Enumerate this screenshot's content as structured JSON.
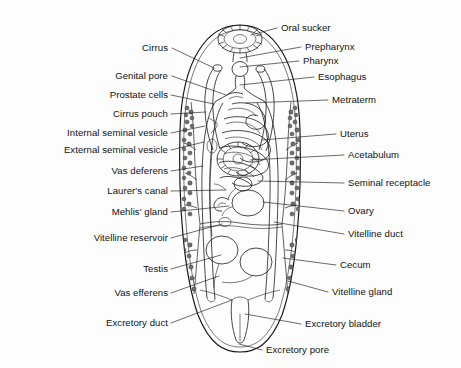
{
  "figure": {
    "style": "black and white scanned line drawing with stippled shading",
    "background_color": "#fdfdfd",
    "ink_color": "#141414",
    "label_count": 24
  },
  "labels_left": [
    {
      "id": "cirrus",
      "text": "Cirrus",
      "text_x": 168,
      "text_y": 51,
      "leader": "M172,48 L214,68"
    },
    {
      "id": "genital-pore",
      "text": "Genital pore",
      "text_x": 168,
      "text_y": 79,
      "leader": "M172,76 L226,95"
    },
    {
      "id": "prostate-cells",
      "text": "Prostate cells",
      "text_x": 168,
      "text_y": 98,
      "leader": "M171,95 L214,104"
    },
    {
      "id": "cirrus-pouch",
      "text": "Cirrus pouch",
      "text_x": 168,
      "text_y": 117,
      "leader": "M171,114 L206,112"
    },
    {
      "id": "internal-seminal-vesicle",
      "text": "Internal seminal vesicle",
      "text_x": 168,
      "text_y": 136,
      "leader": "M171,133 L205,126"
    },
    {
      "id": "external-seminal-vesicle",
      "text": "External seminal vesicle",
      "text_x": 168,
      "text_y": 153,
      "leader": "M171,150 L204,142"
    },
    {
      "id": "vas-deferens",
      "text": "Vas deferens",
      "text_x": 168,
      "text_y": 174,
      "leader": "M171,171 L203,166"
    },
    {
      "id": "laurers-canal",
      "text": "Laurer's canal",
      "text_x": 168,
      "text_y": 194,
      "leader": "M171,191 L226,190"
    },
    {
      "id": "mehlis-gland",
      "text": "Mehlis' gland",
      "text_x": 168,
      "text_y": 215,
      "leader": "M171,212 L229,206"
    },
    {
      "id": "vitelline-reservoir",
      "text": "Vitelline reservoir",
      "text_x": 168,
      "text_y": 241,
      "leader": "M171,238 L222,224"
    },
    {
      "id": "testis",
      "text": "Testis",
      "text_x": 168,
      "text_y": 272,
      "leader": "M171,269 L221,255"
    },
    {
      "id": "vas-efferens",
      "text": "Vas efferens",
      "text_x": 168,
      "text_y": 296,
      "leader": "M171,293 L219,276"
    },
    {
      "id": "excretory-duct",
      "text": "Excretory duct",
      "text_x": 168,
      "text_y": 326,
      "leader": "M171,323 L232,300"
    }
  ],
  "labels_right": [
    {
      "id": "oral-sucker",
      "text": "Oral sucker",
      "text_x": 281,
      "text_y": 31,
      "leader": "M277,28 L251,35"
    },
    {
      "id": "prepharynx",
      "text": "Prepharynx",
      "text_x": 305,
      "text_y": 50,
      "leader": "M301,47 L240,58"
    },
    {
      "id": "pharynx",
      "text": "Pharynx",
      "text_x": 303,
      "text_y": 64,
      "leader": "M299,61 L240,67"
    },
    {
      "id": "esophagus",
      "text": "Esophagus",
      "text_x": 318,
      "text_y": 80,
      "leader": "M314,77 L240,85"
    },
    {
      "id": "metraterm",
      "text": "Metraterm",
      "text_x": 332,
      "text_y": 103,
      "leader": "M328,100 L246,103"
    },
    {
      "id": "uterus",
      "text": "Uterus",
      "text_x": 340,
      "text_y": 137,
      "leader": "M336,134 L262,140"
    },
    {
      "id": "acetabulum",
      "text": "Acetabulum",
      "text_x": 348,
      "text_y": 158,
      "leader": "M344,155 L250,160"
    },
    {
      "id": "seminal-receptacle",
      "text": "Seminal receptacle",
      "text_x": 348,
      "text_y": 186,
      "leader": "M344,183 L258,181"
    },
    {
      "id": "ovary",
      "text": "Ovary",
      "text_x": 348,
      "text_y": 214,
      "leader": "M344,211 L263,202"
    },
    {
      "id": "vitelline-duct",
      "text": "Vitelline duct",
      "text_x": 348,
      "text_y": 237,
      "leader": "M344,234 L274,222"
    },
    {
      "id": "cecum",
      "text": "Cecum",
      "text_x": 340,
      "text_y": 268,
      "leader": "M336,265 L283,258"
    },
    {
      "id": "vitelline-gland",
      "text": "Vitelline gland",
      "text_x": 332,
      "text_y": 295,
      "leader": "M328,292 L288,281"
    },
    {
      "id": "excretory-bladder",
      "text": "Excretory bladder",
      "text_x": 305,
      "text_y": 327,
      "leader": "M301,324 L245,314"
    }
  ],
  "labels_bottom": [
    {
      "id": "excretory-pore",
      "text": "Excretory pore",
      "text_x": 266,
      "text_y": 353,
      "leader": "M262,350 L239,344"
    }
  ]
}
